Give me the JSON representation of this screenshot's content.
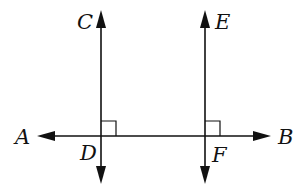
{
  "diagram": {
    "type": "geometry",
    "colors": {
      "stroke": "#111111",
      "background": "#ffffff"
    },
    "labels": {
      "A": "A",
      "B": "B",
      "C": "C",
      "D": "D",
      "E": "E",
      "F": "F"
    },
    "lines": [
      {
        "name": "AB",
        "orientation": "horizontal",
        "arrows": "both"
      },
      {
        "name": "CD",
        "orientation": "vertical",
        "arrows": "both"
      },
      {
        "name": "EF",
        "orientation": "vertical",
        "arrows": "both"
      }
    ],
    "right_angle_marks": [
      "D",
      "F"
    ]
  }
}
